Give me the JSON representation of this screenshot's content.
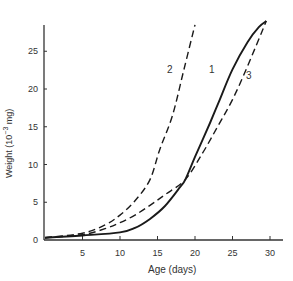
{
  "chart_data": {
    "type": "line",
    "title": "",
    "xlabel": "Age (days)",
    "ylabel": "Weight (10⁻³ mg)",
    "xlim": [
      0,
      32
    ],
    "ylim": [
      0,
      28
    ],
    "xticks": [
      5,
      10,
      15,
      20,
      25,
      30
    ],
    "yticks": [
      0,
      5,
      10,
      15,
      20,
      25
    ],
    "grid": false,
    "legend": "inline curve labels",
    "series": [
      {
        "name": "1",
        "style": "solid",
        "x": [
          0,
          5,
          10,
          12,
          14,
          16,
          18,
          18.7,
          20,
          22,
          23.3,
          25,
          27,
          28.5,
          29.5
        ],
        "y": [
          0.3,
          0.6,
          1.0,
          1.6,
          2.8,
          4.5,
          7.0,
          8.0,
          11.0,
          15.5,
          18.6,
          22.6,
          26.2,
          28.2,
          29.0
        ]
      },
      {
        "name": "2",
        "style": "dashed",
        "x": [
          0,
          5,
          8,
          10,
          12,
          14,
          15.3,
          17,
          18.5,
          20
        ],
        "y": [
          0.3,
          0.9,
          2.0,
          3.3,
          5.2,
          8.0,
          12.0,
          16.5,
          22.5,
          28.5
        ]
      },
      {
        "name": "3",
        "style": "dashed",
        "x": [
          0,
          5,
          8,
          10,
          12,
          14,
          16,
          18.7,
          21,
          23,
          25,
          27,
          29.5
        ],
        "y": [
          0.3,
          0.7,
          1.5,
          2.3,
          3.3,
          4.6,
          6.0,
          8.0,
          11.5,
          15.0,
          18.6,
          23.0,
          29.0
        ]
      }
    ],
    "annotations": [
      {
        "text": "1",
        "near_x": 21.8,
        "near_y": 22.5
      },
      {
        "text": "2",
        "near_x": 14.9,
        "near_y": 22.5
      },
      {
        "text": "3",
        "near_x": 26.6,
        "near_y": 21.8
      }
    ]
  },
  "axis": {
    "xlabel": "Age (days)",
    "ylabel_main": "Weight (10",
    "ylabel_sup": "−3",
    "ylabel_end": " mg)",
    "xtick_labels": [
      "5",
      "10",
      "15",
      "20",
      "25",
      "30"
    ],
    "ytick_labels": [
      "0",
      "5",
      "10",
      "15",
      "20",
      "25"
    ]
  },
  "labels": {
    "c1": "1",
    "c2": "2",
    "c3": "3"
  }
}
